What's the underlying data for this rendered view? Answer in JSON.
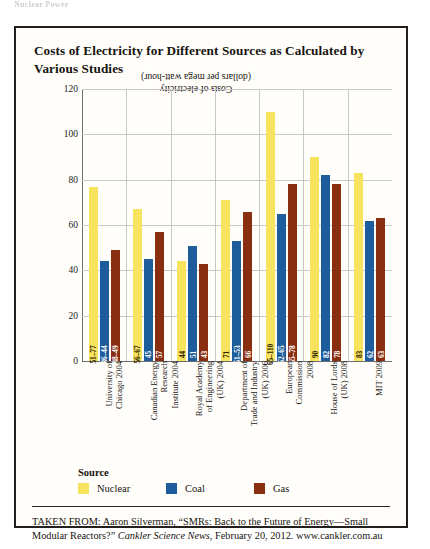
{
  "page_header": "Nuclear Power",
  "figure": {
    "title": "Costs of Electricity for Different Sources as Calculated by Various Studies",
    "caption": {
      "prefix": "TAKEN FROM: Aaron Silverman, “SMRs: Back to the Future of Energy—Small Modular Reactors?” ",
      "italic": "Cankler Science News",
      "suffix": ", February 20, 2012. www.cankler.com.au"
    }
  },
  "legend": {
    "title": "Source",
    "items": [
      {
        "label": "Nuclear",
        "color": "#F7E35E"
      },
      {
        "label": "Coal",
        "color": "#1D5D9B"
      },
      {
        "label": "Gas",
        "color": "#8A2E12"
      }
    ]
  },
  "chart_data": {
    "type": "bar",
    "title": "Costs of Electricity for Different Sources as Calculated by Various Studies",
    "xlabel": "",
    "ylabel": "Costs of electricity (dollars per mega watt-hour)",
    "ylabel_line1": "Costs of electricity",
    "ylabel_line2": "(dollars per mega watt-hour)",
    "ylim": [
      0,
      120
    ],
    "yticks": [
      0,
      20,
      40,
      60,
      80,
      100,
      120
    ],
    "grid": true,
    "legend_position": "below-plot",
    "categories": [
      "University of Chicago 2004",
      "Canadian Energy Research Institute 2004",
      "Royal Academy of Engineering (UK) 2004",
      "Department of Trade and Industry (UK) 2006",
      "European Commission 2008",
      "House of Lords (UK) 2008",
      "MIT 2009"
    ],
    "category_lines": [
      [
        "University of",
        "Chicago 2004"
      ],
      [
        "Canadian Energy",
        "Research",
        "Institute 2004"
      ],
      [
        "Royal Academy",
        "of Engineering",
        "(UK) 2004"
      ],
      [
        "Department of",
        "Trade and Industry",
        "(UK) 2006"
      ],
      [
        "European",
        "Commission",
        "2008"
      ],
      [
        "House of Lords",
        "(UK) 2008"
      ],
      [
        "MIT 2009"
      ]
    ],
    "series": [
      {
        "name": "Nuclear",
        "color": "#F7E35E",
        "values": [
          77,
          67,
          44,
          71,
          110,
          90,
          83
        ],
        "labels": [
          "51–77",
          "56–67",
          "44",
          "71",
          "65–110",
          "90",
          "83"
        ]
      },
      {
        "name": "Coal",
        "color": "#1D5D9B",
        "values": [
          44,
          45,
          51,
          53,
          65,
          82,
          62
        ],
        "labels": [
          "36–44",
          "45",
          "51",
          "51–53",
          "52–65",
          "82",
          "62"
        ]
      },
      {
        "name": "Gas",
        "color": "#8A2E12",
        "values": [
          49,
          57,
          43,
          66,
          78,
          78,
          63
        ],
        "labels": [
          "38–49",
          "57",
          "43",
          "66",
          "65–78",
          "78",
          "63"
        ]
      }
    ]
  }
}
